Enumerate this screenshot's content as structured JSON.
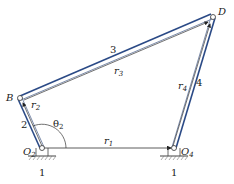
{
  "colors": {
    "link": "#2b4a86",
    "vector": "#333333",
    "ground": "#555555",
    "background": "#ffffff"
  },
  "points": {
    "O2": {
      "x": 42,
      "y": 148,
      "label": "O",
      "sub": "2"
    },
    "B": {
      "x": 20,
      "y": 98,
      "label": "B"
    },
    "D": {
      "x": 213,
      "y": 17,
      "label": "D"
    },
    "O4": {
      "x": 174,
      "y": 148,
      "label": "O",
      "sub": "4"
    }
  },
  "links": [
    {
      "id": "2",
      "label": "2",
      "from": "O2",
      "to": "B"
    },
    {
      "id": "3",
      "label": "3",
      "from": "B",
      "to": "D"
    },
    {
      "id": "4",
      "label": "4",
      "from": "O4",
      "to": "D"
    }
  ],
  "vectors": [
    {
      "id": "r1",
      "label": "r",
      "sub": "1"
    },
    {
      "id": "r2",
      "label": "r",
      "sub": "2"
    },
    {
      "id": "r3",
      "label": "r",
      "sub": "3"
    },
    {
      "id": "r4",
      "label": "r",
      "sub": "4"
    }
  ],
  "angle": {
    "label": "θ",
    "sub": "2"
  },
  "ground_labels": [
    "1",
    "1"
  ]
}
